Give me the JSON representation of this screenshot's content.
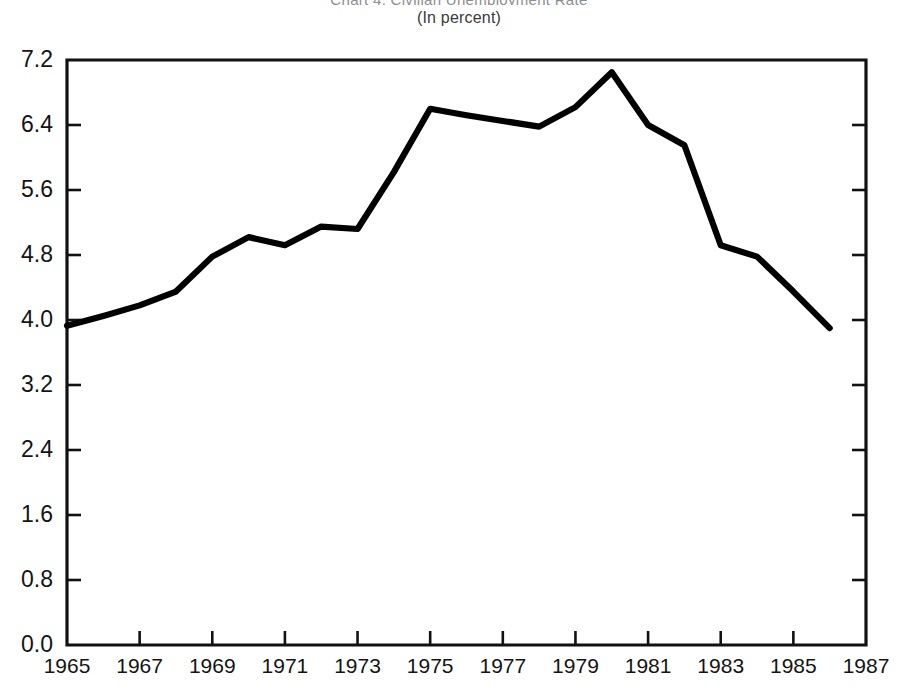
{
  "figure": {
    "title_clipped": "Chart 4. Civilian Unemployment Rate",
    "subtitle": "(In percent)"
  },
  "chart_data": {
    "type": "line",
    "title": "Chart 4. Civilian Unemployment Rate",
    "subtitle": "(In percent)",
    "xlabel": "",
    "ylabel": "",
    "xlim": [
      1965,
      1987
    ],
    "ylim": [
      0.0,
      7.2
    ],
    "grid": false,
    "legend": null,
    "y_ticks": [
      "0.0",
      "0.8",
      "1.6",
      "2.4",
      "3.2",
      "4.0",
      "4.8",
      "5.6",
      "6.4",
      "7.2"
    ],
    "y_tick_values": [
      0.0,
      0.8,
      1.6,
      2.4,
      3.2,
      4.0,
      4.8,
      5.6,
      6.4,
      7.2
    ],
    "x_ticks": [
      "1965",
      "1967",
      "1969",
      "1971",
      "1973",
      "1975",
      "1977",
      "1979",
      "1981",
      "1983",
      "1985",
      "1987"
    ],
    "x_tick_values": [
      1965,
      1967,
      1969,
      1971,
      1973,
      1975,
      1977,
      1979,
      1981,
      1983,
      1985,
      1987
    ],
    "series": [
      {
        "name": "Unemployment rate",
        "color": "#000000",
        "x": [
          1965,
          1966,
          1967,
          1968,
          1969,
          1970,
          1971,
          1972,
          1973,
          1974,
          1975,
          1976,
          1977,
          1978,
          1979,
          1980,
          1981,
          1982,
          1983,
          1984,
          1985,
          1986
        ],
        "values": [
          3.93,
          4.05,
          4.18,
          4.35,
          4.78,
          5.02,
          4.92,
          5.15,
          5.12,
          5.82,
          6.6,
          6.52,
          6.45,
          6.38,
          6.62,
          7.05,
          6.4,
          6.15,
          4.92,
          4.78,
          4.35,
          3.9
        ]
      }
    ]
  },
  "plot_geometry": {
    "left": 67,
    "right": 866,
    "top": 60,
    "bottom": 645
  }
}
